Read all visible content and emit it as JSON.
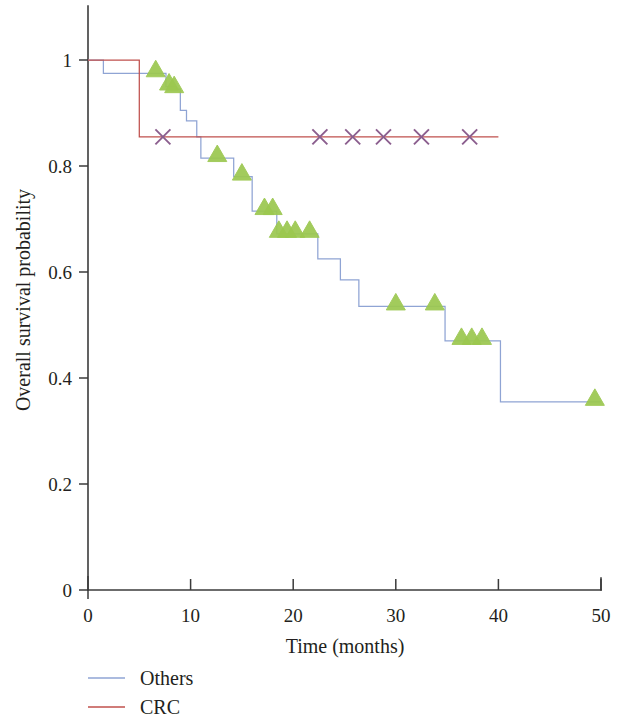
{
  "chart_data": {
    "type": "line",
    "title": "",
    "subtitle": "",
    "xlabel": "Time (months)",
    "ylabel": "Overall survival probability",
    "xlim": [
      0,
      50
    ],
    "ylim": [
      0,
      1
    ],
    "x_ticks": [
      0,
      10,
      20,
      30,
      40,
      50
    ],
    "x_tick_labels": [
      "0",
      "10",
      "20",
      "30",
      "40",
      "50"
    ],
    "y_ticks": [
      0,
      0.2,
      0.4,
      0.6,
      0.8,
      1
    ],
    "y_tick_labels": [
      "0",
      "0.2",
      "0.4",
      "0.6",
      "0.8",
      "1"
    ],
    "grid": false,
    "legend_position": "below-left",
    "plot_style": "kaplan-meier step curves with censoring markers",
    "series": [
      {
        "name": "Others",
        "color": "#8fa4d4",
        "censor_marker": "triangle",
        "censor_marker_color": "#9cc850",
        "steps": [
          [
            0.0,
            1.0
          ],
          [
            1.5,
            0.975
          ],
          [
            7.0,
            0.975
          ],
          [
            7.6,
            0.95
          ],
          [
            8.6,
            0.945
          ],
          [
            9.0,
            0.905
          ],
          [
            9.6,
            0.885
          ],
          [
            10.6,
            0.855
          ],
          [
            11.0,
            0.815
          ],
          [
            13.8,
            0.815
          ],
          [
            14.2,
            0.78
          ],
          [
            15.6,
            0.78
          ],
          [
            16.0,
            0.715
          ],
          [
            18.0,
            0.715
          ],
          [
            18.4,
            0.672
          ],
          [
            22.0,
            0.672
          ],
          [
            22.4,
            0.625
          ],
          [
            24.2,
            0.625
          ],
          [
            24.6,
            0.585
          ],
          [
            26.0,
            0.585
          ],
          [
            26.4,
            0.535
          ],
          [
            34.4,
            0.535
          ],
          [
            34.8,
            0.47
          ],
          [
            39.8,
            0.47
          ],
          [
            40.2,
            0.355
          ],
          [
            50.0,
            0.355
          ]
        ],
        "censor_points": [
          [
            6.6,
            0.975
          ],
          [
            7.9,
            0.95
          ],
          [
            8.4,
            0.945
          ],
          [
            12.6,
            0.815
          ],
          [
            15.0,
            0.78
          ],
          [
            17.2,
            0.715
          ],
          [
            18.0,
            0.715
          ],
          [
            18.6,
            0.672
          ],
          [
            19.4,
            0.672
          ],
          [
            20.2,
            0.672
          ],
          [
            21.6,
            0.672
          ],
          [
            30.0,
            0.535
          ],
          [
            33.8,
            0.535
          ],
          [
            36.4,
            0.47
          ],
          [
            37.4,
            0.47
          ],
          [
            38.4,
            0.47
          ],
          [
            49.4,
            0.355
          ]
        ]
      },
      {
        "name": "CRC",
        "color": "#c0504d",
        "censor_marker": "x",
        "censor_marker_color": "#8b5e8e",
        "steps": [
          [
            0.0,
            1.0
          ],
          [
            5.0,
            1.0
          ],
          [
            5.0,
            0.855
          ],
          [
            40.0,
            0.855
          ]
        ],
        "censor_points": [
          [
            7.3,
            0.855
          ],
          [
            22.6,
            0.855
          ],
          [
            25.8,
            0.855
          ],
          [
            28.8,
            0.855
          ],
          [
            32.5,
            0.855
          ],
          [
            37.2,
            0.855
          ]
        ]
      }
    ]
  },
  "legend": {
    "items": [
      {
        "label": "Others",
        "color": "#8fa4d4"
      },
      {
        "label": "CRC",
        "color": "#c0504d"
      }
    ]
  },
  "axes": {
    "x_title": "Time (months)",
    "y_title": "Overall survival probability"
  }
}
